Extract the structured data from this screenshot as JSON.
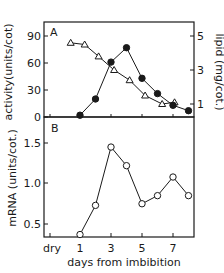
{
  "chart_data": [
    {
      "panel": "A",
      "type": "line",
      "xlabel": "days from imbibition",
      "x_tick_labels": [
        "dry",
        "1",
        "3",
        "5",
        "7"
      ],
      "ylabel_left": "activity(units/cot)",
      "ylabel_right": "lipid (mg/cot.)",
      "yticks_left": [
        0,
        30,
        60,
        90
      ],
      "yticks_right": [
        1,
        3,
        5
      ],
      "ylim_left": [
        0,
        100
      ],
      "ylim_right": [
        0,
        5.7
      ],
      "series": [
        {
          "name": "activity",
          "marker": "filled-circle",
          "axis": "left",
          "x": [
            1,
            2,
            3,
            4,
            5,
            6,
            7,
            8
          ],
          "values": [
            2,
            20,
            61,
            77,
            43,
            26,
            13,
            7
          ]
        },
        {
          "name": "lipid",
          "marker": "open-triangle",
          "axis": "right",
          "x": [
            0.4,
            1.3,
            2.2,
            3.2,
            4.2,
            5.2,
            6.3,
            7.1
          ],
          "values": [
            4.6,
            4.5,
            3.8,
            3.0,
            2.4,
            1.5,
            1.0,
            1.1
          ]
        }
      ]
    },
    {
      "panel": "B",
      "type": "line",
      "xlabel": "days from imbibition",
      "x_tick_labels": [
        "dry",
        "1",
        "3",
        "5",
        "7"
      ],
      "ylabel": "mRNA (units/cot.)",
      "yticks": [
        0.5,
        1.0,
        1.5
      ],
      "ylim": [
        0.34,
        1.8
      ],
      "series": [
        {
          "name": "mRNA",
          "marker": "open-circle",
          "x": [
            1,
            2,
            3,
            4,
            5,
            6,
            7,
            8
          ],
          "values": [
            0.37,
            0.73,
            1.45,
            1.22,
            0.75,
            0.85,
            1.08,
            0.85
          ]
        }
      ]
    }
  ],
  "labels": {
    "panel_a": "A",
    "panel_b": "B",
    "ylabel_a_left": "activity(units/cot)",
    "ylabel_a_right": "lipid (mg/cot.)",
    "ylabel_b": "mRNA (units/cot.)",
    "xlabel": "days from imbibition",
    "yticks_a_left": [
      "0",
      "30",
      "60",
      "90"
    ],
    "yticks_a_right": [
      "1",
      "3",
      "5"
    ],
    "yticks_b": [
      "0.5",
      "1.0",
      "1.5"
    ],
    "xticks": [
      "dry",
      "1",
      "3",
      "5",
      "7"
    ]
  },
  "colors": {
    "ink": "#1a1a1a",
    "background": "#ffffff"
  }
}
